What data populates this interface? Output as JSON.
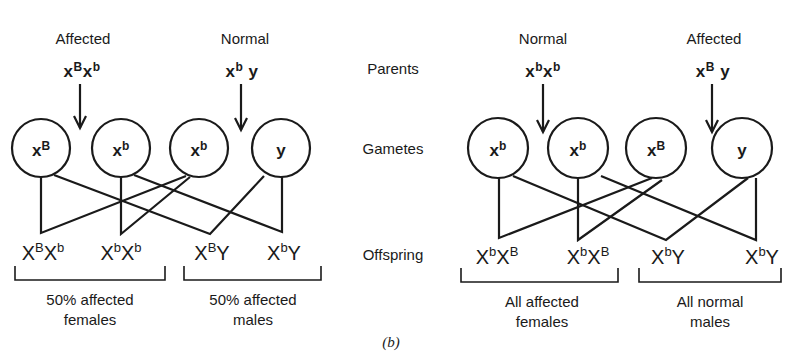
{
  "row_labels": {
    "parents": "Parents",
    "gametes": "Gametes",
    "offspring": "Offspring"
  },
  "left_cross": {
    "mother": {
      "phenotype": "Affected",
      "genotype": {
        "a": "x",
        "a_sup": "B",
        "b": "x",
        "b_sup": "b"
      }
    },
    "father": {
      "phenotype": "Normal",
      "genotype": {
        "a": "x",
        "a_sup": "b",
        "b": "y",
        "b_sup": ""
      }
    },
    "gametes": [
      {
        "base": "x",
        "sup": "B"
      },
      {
        "base": "x",
        "sup": "b"
      },
      {
        "base": "x",
        "sup": "b"
      },
      {
        "base": "y",
        "sup": ""
      }
    ],
    "offspring": [
      {
        "a": "X",
        "a_sup": "B",
        "b": "X",
        "b_sup": "b"
      },
      {
        "a": "X",
        "a_sup": "b",
        "b": "X",
        "b_sup": "b"
      },
      {
        "a": "X",
        "a_sup": "B",
        "b": "Y",
        "b_sup": ""
      },
      {
        "a": "X",
        "a_sup": "b",
        "b": "Y",
        "b_sup": ""
      }
    ],
    "summary_females": {
      "line1": "50%  affected",
      "line2": "females"
    },
    "summary_males": {
      "line1": "50%  affected",
      "line2": "males"
    }
  },
  "right_cross": {
    "mother": {
      "phenotype": "Normal",
      "genotype": {
        "a": "x",
        "a_sup": "b",
        "b": "x",
        "b_sup": "b"
      }
    },
    "father": {
      "phenotype": "Affected",
      "genotype": {
        "a": "x",
        "a_sup": "B",
        "b": "y",
        "b_sup": ""
      }
    },
    "gametes": [
      {
        "base": "x",
        "sup": "b"
      },
      {
        "base": "x",
        "sup": "b"
      },
      {
        "base": "x",
        "sup": "B"
      },
      {
        "base": "y",
        "sup": ""
      }
    ],
    "offspring": [
      {
        "a": "X",
        "a_sup": "b",
        "b": "X",
        "b_sup": "B"
      },
      {
        "a": "X",
        "a_sup": "b",
        "b": "X",
        "b_sup": "B"
      },
      {
        "a": "X",
        "a_sup": "b",
        "b": "Y",
        "b_sup": ""
      },
      {
        "a": "X",
        "a_sup": "b",
        "b": "Y",
        "b_sup": ""
      }
    ],
    "summary_females": {
      "line1": "All  affected",
      "line2": "females"
    },
    "summary_males": {
      "line1": "All  normal",
      "line2": "males"
    }
  },
  "caption": "(b)",
  "colors": {
    "ink": "#1a1a1a",
    "background": "#ffffff"
  }
}
